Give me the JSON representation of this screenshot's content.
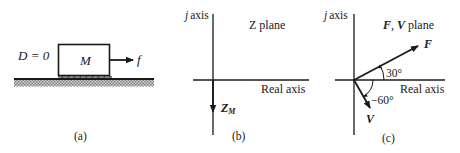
{
  "panels": {
    "a": {
      "caption": "(a)",
      "damping_label": "D = 0",
      "mass_label": "M",
      "force_label": "f"
    },
    "b": {
      "caption": "(b)",
      "vertical_axis_label": "j axis",
      "horizontal_axis_label": "Real axis",
      "plane_label": "Z plane",
      "vector_label_main": "Z",
      "vector_label_sub": "M"
    },
    "c": {
      "caption": "(c)",
      "vertical_axis_label": "j axis",
      "horizontal_axis_label": "Real axis",
      "plane_label": "F, V plane",
      "vector_f_label": "F",
      "vector_v_label": "V",
      "angle_f_label": "30°",
      "angle_v_label": "−60°"
    }
  },
  "colors": {
    "ink": "#1a1a1a",
    "background": "#ffffff",
    "ground_hatch": "#9a9a9a"
  }
}
